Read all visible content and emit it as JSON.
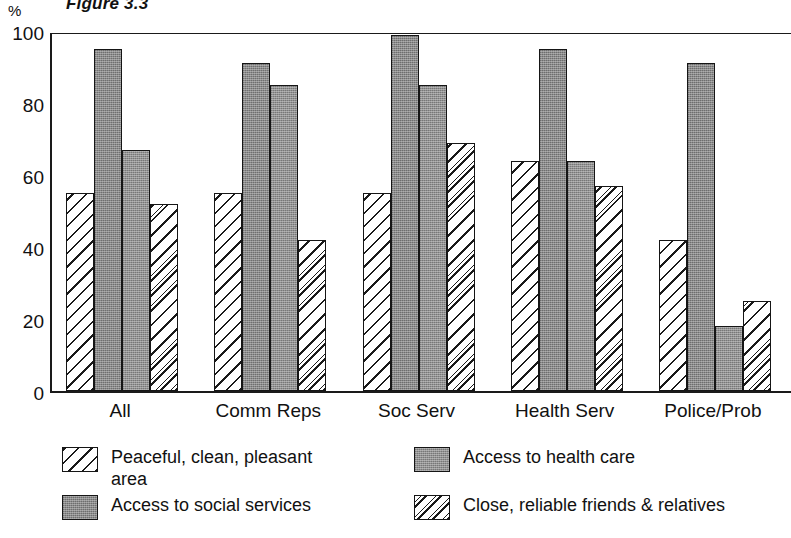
{
  "figure": {
    "title": "Figure 3.3",
    "unit_label": "%"
  },
  "chart_data": {
    "type": "bar",
    "title": "Figure 3.3",
    "xlabel": "",
    "ylabel": "%",
    "ylim": [
      0,
      100
    ],
    "yticks": [
      0,
      20,
      40,
      60,
      80,
      100
    ],
    "grid": false,
    "legend_position": "bottom",
    "categories": [
      "All",
      "Comm Reps",
      "Soc Serv",
      "Health Serv",
      "Police/Prob"
    ],
    "series": [
      {
        "name": "Peaceful, clean, pleasant area",
        "pattern": "diagonal-hatch",
        "color": "#ffffff",
        "values": [
          55,
          55,
          55,
          64,
          42
        ]
      },
      {
        "name": "Access to social services",
        "pattern": "solid-gray",
        "color": "#8a8a8a",
        "values": [
          95,
          91,
          99,
          95,
          91
        ]
      },
      {
        "name": "Access to health care",
        "pattern": "solid-gray",
        "color": "#919191",
        "values": [
          67,
          85,
          85,
          64,
          18
        ]
      },
      {
        "name": "Close, reliable friends & relatives",
        "pattern": "dashed-diagonal-hatch",
        "color": "#ffffff",
        "values": [
          52,
          42,
          69,
          57,
          25
        ]
      }
    ]
  },
  "legend": {
    "items": [
      {
        "label": "Peaceful, clean, pleasant\narea"
      },
      {
        "label": "Access to social services"
      },
      {
        "label": "Access to health care"
      },
      {
        "label": "Close, reliable friends & relatives"
      }
    ]
  }
}
